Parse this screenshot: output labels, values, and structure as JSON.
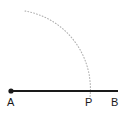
{
  "figure": {
    "background_color": "#ffffff",
    "width": 130,
    "height": 115,
    "line_color": "#1a1a1a",
    "arc_color": "#b0b0b0",
    "label_color": "#1a1a1a"
  },
  "labels": {
    "a": "A",
    "p": "P",
    "b": "B"
  },
  "geometry": {
    "segment": {
      "name": "AB",
      "x1": 11,
      "y1": 91,
      "x2": 118,
      "y2": 91,
      "stroke_width": 2
    },
    "points": [
      {
        "name": "A",
        "label": "A",
        "x": 11,
        "y": 91,
        "marker": "filled-dot",
        "radius": 2.6
      },
      {
        "name": "P",
        "label": "P",
        "x": 90,
        "y": 91,
        "marker": "none",
        "radius": 0
      },
      {
        "name": "B",
        "label": "B",
        "x": 118,
        "y": 91,
        "marker": "none",
        "radius": 0
      }
    ],
    "arc": {
      "name": "compass-arc",
      "center_x": 11,
      "center_y": 91,
      "radius": 79,
      "start_x": 25,
      "start_y": 11,
      "end_x": 90,
      "end_y": 97,
      "style": "dotted",
      "stroke_width": 1.1,
      "dash_pattern": "0.8 2.2"
    }
  }
}
